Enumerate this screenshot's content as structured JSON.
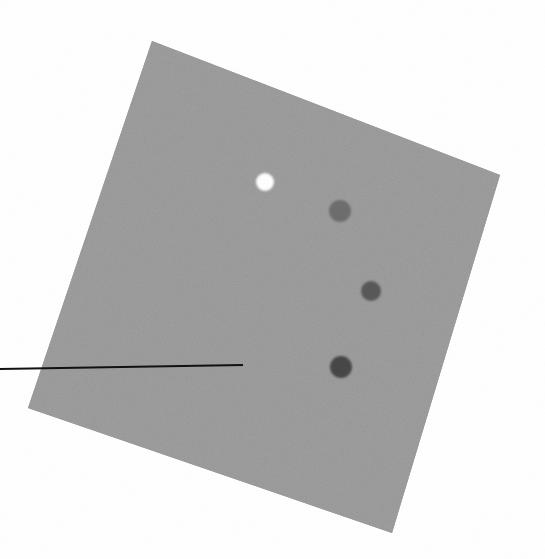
{
  "image": {
    "title": "Scanned tilted gray square with marker dots",
    "width": 545,
    "height": 559,
    "background_color": "#ffffff",
    "media": "grayscale scan / photograph",
    "description": "A light gray noisy square panel rotated clockwise on a white background, bearing four circular marker dots of differing darkness and a thin black horizontal pointer line entering from the left edge."
  },
  "panel": {
    "name": "gray-square",
    "fill_color": "#9e9e9e",
    "edge_color": "#969696",
    "rotation_degrees": 21,
    "corners": {
      "top_left": {
        "x": 152,
        "y": 41
      },
      "top_right": {
        "x": 500,
        "y": 175
      },
      "bottom_right": {
        "x": 392,
        "y": 533
      },
      "bottom_left": {
        "x": 28,
        "y": 408
      }
    },
    "center": {
      "x": 268,
      "y": 289
    },
    "side_length_px": 373,
    "texture": "fine random grain / halftone noise"
  },
  "markers": [
    {
      "label": "marker-1",
      "tone": "white",
      "color": "#fdfdfd",
      "cx": 265,
      "cy": 182,
      "r": 9
    },
    {
      "label": "marker-2",
      "tone": "medium gray",
      "color": "#6d6d6d",
      "cx": 340,
      "cy": 211,
      "r": 11
    },
    {
      "label": "marker-3",
      "tone": "dark gray",
      "color": "#585858",
      "cx": 371,
      "cy": 291,
      "r": 10
    },
    {
      "label": "marker-4",
      "tone": "darkest gray",
      "color": "#474747",
      "cx": 341,
      "cy": 367,
      "r": 11
    }
  ],
  "pointer_line": {
    "label": "pointer-line",
    "color": "#111111",
    "thickness_px": 2,
    "x1": 0,
    "y1": 369,
    "x2": 243,
    "y2": 365
  }
}
